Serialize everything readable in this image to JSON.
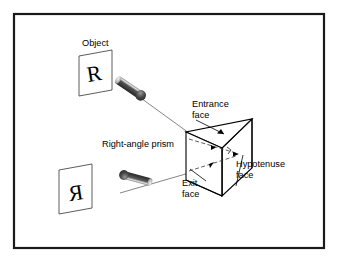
{
  "figure": {
    "kind": "optical-diagram",
    "title_visible": false,
    "background_color": "#ffffff",
    "frame": {
      "name": "outer-border",
      "color": "#1a1a1a",
      "x": 13,
      "y": 13,
      "width": 312,
      "height": 236,
      "stroke_width": 2
    }
  },
  "labels": {
    "object": "Object",
    "entrance_face_line1": "Entrance",
    "entrance_face_line2": "face",
    "right_angle_prism": "Right-angle prism",
    "hypotenuse_face_line1": "Hypotenuse",
    "hypotenuse_face_line2": "face",
    "exit_face_line1": "Exit",
    "exit_face_line2": "face"
  },
  "glyphs": {
    "object_letter": "R",
    "image_letter": "R",
    "image_letter_note": "mirror-reversed R"
  },
  "colors": {
    "ink": "#000000",
    "frame": "#1a1a1a",
    "ray_line": "#555555",
    "arrow_dark": "#3a3a3a",
    "arrow_mid": "#6e6e6e",
    "arrow_light": "#9a9a9a",
    "prism_stroke": "#000000",
    "prism_fill": "#ffffff",
    "dashed_ray": "#444444"
  },
  "prism": {
    "name": "right-angle-prism",
    "description": "triangular right-angle prism drawn in oblique 3D projection",
    "front_face_corners": [
      [
        186,
        132
      ],
      [
        186,
        180
      ],
      [
        222,
        196
      ],
      [
        222,
        148
      ]
    ],
    "apex_back_top": [
      252,
      119
    ],
    "apex_back_bottom": [
      252,
      168
    ],
    "right_angle_marker": true
  },
  "rays": {
    "incoming": {
      "name": "incoming-ray",
      "from": [
        122,
        85
      ],
      "to": [
        196,
        140
      ],
      "direction": "toward-prism"
    },
    "outgoing": {
      "name": "outgoing-ray",
      "from": [
        196,
        172
      ],
      "to": [
        116,
        196
      ],
      "direction": "away-from-prism"
    },
    "internal_upper": {
      "from": [
        190,
        140
      ],
      "to": [
        236,
        152
      ]
    },
    "internal_lower": {
      "from": [
        190,
        170
      ],
      "to": [
        236,
        156
      ]
    }
  },
  "object_card": {
    "name": "object-card",
    "corners": [
      [
        80,
        56
      ],
      [
        112,
        51
      ],
      [
        112,
        90
      ],
      [
        80,
        95
      ]
    ]
  },
  "image_card": {
    "name": "image-card",
    "corners": [
      [
        60,
        170
      ],
      [
        92,
        165
      ],
      [
        92,
        209
      ],
      [
        60,
        214
      ]
    ]
  }
}
